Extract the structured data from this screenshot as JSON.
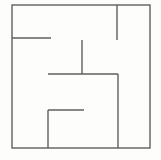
{
  "figure": {
    "canvas_width": 161,
    "canvas_height": 160,
    "background_color": "#fdfdfc",
    "line_color": "#5f5f5f",
    "line_width": 1.4
  },
  "chart_data": {
    "type": "diagram",
    "xlabel": "",
    "ylabel": "",
    "xlim": [
      0,
      161
    ],
    "ylim": [
      0,
      160
    ],
    "grid": false,
    "legend": "none",
    "border": {
      "name": "outer-rectangle",
      "x1": 12,
      "y1": 5,
      "x2": 150,
      "y2": 148
    },
    "segments": [
      {
        "name": "upper-left-horizontal-wall",
        "orientation": "horizontal",
        "x1": 12,
        "y1": 38,
        "x2": 51,
        "y2": 38
      },
      {
        "name": "top-right-vertical-stub",
        "orientation": "vertical",
        "x1": 117,
        "y1": 5,
        "x2": 117,
        "y2": 40
      },
      {
        "name": "center-vertical-wall",
        "orientation": "vertical",
        "x1": 82,
        "y1": 40,
        "x2": 82,
        "y2": 74
      },
      {
        "name": "center-horizontal-wall",
        "orientation": "horizontal",
        "x1": 48,
        "y1": 74,
        "x2": 118,
        "y2": 74
      },
      {
        "name": "right-long-vertical-wall",
        "orientation": "vertical",
        "x1": 118,
        "y1": 74,
        "x2": 118,
        "y2": 148
      },
      {
        "name": "lower-left-vertical-wall",
        "orientation": "vertical",
        "x1": 48,
        "y1": 110,
        "x2": 48,
        "y2": 148
      },
      {
        "name": "lower-left-horizontal-wall",
        "orientation": "horizontal",
        "x1": 48,
        "y1": 110,
        "x2": 84,
        "y2": 110
      }
    ]
  }
}
